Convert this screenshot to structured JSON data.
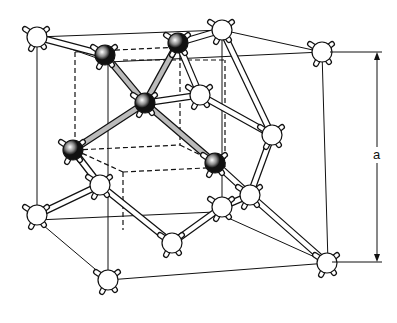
{
  "dimension_label": "a",
  "colors": {
    "line": "#111111",
    "background": "#ffffff",
    "dark_atom": "#111111",
    "light_atom": "#ffffff"
  },
  "cube_edges": [
    [
      37,
      37,
      222,
      30
    ],
    [
      37,
      37,
      108,
      62
    ],
    [
      222,
      30,
      322,
      52
    ],
    [
      108,
      62,
      322,
      52
    ],
    [
      37,
      37,
      37,
      220
    ],
    [
      108,
      62,
      108,
      280
    ],
    [
      322,
      52,
      328,
      263
    ],
    [
      222,
      30,
      222,
      212
    ],
    [
      37,
      220,
      108,
      280
    ],
    [
      108,
      280,
      328,
      263
    ],
    [
      37,
      220,
      215,
      212
    ],
    [
      215,
      212,
      328,
      263
    ]
  ],
  "inner_cube_dashed": [
    [
      75,
      52,
      180,
      47
    ],
    [
      75,
      52,
      75,
      150
    ],
    [
      180,
      47,
      180,
      145
    ],
    [
      75,
      150,
      180,
      145
    ],
    [
      123,
      172,
      225,
      167
    ],
    [
      75,
      150,
      123,
      172
    ],
    [
      180,
      145,
      225,
      167
    ],
    [
      123,
      172,
      123,
      230
    ],
    [
      225,
      167,
      225,
      60
    ],
    [
      123,
      60,
      225,
      60
    ]
  ],
  "bonds_dark": [
    [
      145,
      103,
      105,
      55
    ],
    [
      145,
      103,
      178,
      43
    ],
    [
      145,
      103,
      73,
      150
    ],
    [
      145,
      103,
      215,
      163
    ]
  ],
  "bonds_light": [
    [
      105,
      55,
      37,
      37
    ],
    [
      178,
      43,
      222,
      30
    ],
    [
      215,
      163,
      250,
      195
    ],
    [
      250,
      195,
      272,
      135
    ],
    [
      272,
      135,
      222,
      30
    ],
    [
      250,
      195,
      327,
      263
    ],
    [
      250,
      195,
      222,
      207
    ],
    [
      73,
      150,
      100,
      185
    ],
    [
      100,
      185,
      37,
      215
    ],
    [
      100,
      185,
      172,
      243
    ],
    [
      222,
      207,
      172,
      243
    ],
    [
      200,
      95,
      272,
      135
    ],
    [
      200,
      95,
      178,
      43
    ],
    [
      200,
      95,
      145,
      103
    ]
  ],
  "atoms": [
    {
      "x": 37,
      "y": 37,
      "type": "light"
    },
    {
      "x": 222,
      "y": 30,
      "type": "light"
    },
    {
      "x": 322,
      "y": 52,
      "type": "light"
    },
    {
      "x": 105,
      "y": 55,
      "type": "dark"
    },
    {
      "x": 178,
      "y": 43,
      "type": "dark"
    },
    {
      "x": 145,
      "y": 103,
      "type": "dark"
    },
    {
      "x": 73,
      "y": 150,
      "type": "dark"
    },
    {
      "x": 215,
      "y": 163,
      "type": "dark"
    },
    {
      "x": 200,
      "y": 95,
      "type": "light"
    },
    {
      "x": 272,
      "y": 135,
      "type": "light"
    },
    {
      "x": 100,
      "y": 185,
      "type": "light"
    },
    {
      "x": 37,
      "y": 215,
      "type": "light"
    },
    {
      "x": 250,
      "y": 195,
      "type": "light"
    },
    {
      "x": 222,
      "y": 207,
      "type": "light"
    },
    {
      "x": 172,
      "y": 243,
      "type": "light"
    },
    {
      "x": 108,
      "y": 280,
      "type": "light"
    },
    {
      "x": 327,
      "y": 263,
      "type": "light"
    }
  ],
  "dimension_arrow": {
    "x": 377,
    "top": 52,
    "bottom": 262,
    "label_y": 155
  }
}
